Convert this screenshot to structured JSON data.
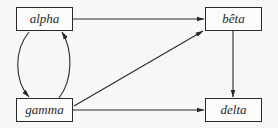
{
  "diagram": {
    "type": "directed-graph",
    "nodes": [
      {
        "id": "alpha",
        "label": "alpha"
      },
      {
        "id": "beta",
        "label": "bêta"
      },
      {
        "id": "gamma",
        "label": "gamma"
      },
      {
        "id": "delta",
        "label": "delta"
      }
    ],
    "edges": [
      {
        "from": "alpha",
        "to": "beta"
      },
      {
        "from": "alpha",
        "to": "gamma"
      },
      {
        "from": "gamma",
        "to": "alpha"
      },
      {
        "from": "gamma",
        "to": "beta"
      },
      {
        "from": "gamma",
        "to": "delta"
      },
      {
        "from": "beta",
        "to": "delta"
      }
    ],
    "colors": {
      "stroke": "#2a2a2a",
      "background": "#f7f7f5"
    }
  }
}
